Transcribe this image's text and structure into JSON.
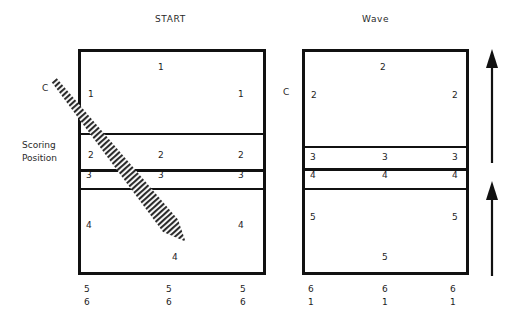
{
  "diagram": {
    "titles": {
      "left": "START",
      "right": "Wave"
    },
    "labels": {
      "scoring_position": "Scoring\nPosition",
      "coach_left": "C",
      "coach_right": "C"
    },
    "left_court": {
      "name": "START",
      "rows": [
        {
          "position": "1",
          "back": "1",
          "left": "1",
          "right": "1"
        },
        {
          "position": "2",
          "left": "2",
          "center": "2",
          "right": "2"
        },
        {
          "position": "3",
          "left": "3",
          "center": "3",
          "right": "3"
        },
        {
          "position": "4",
          "left": "4",
          "center": "4",
          "right": "4"
        }
      ],
      "bottom": [
        {
          "top": "5",
          "bottom": "6"
        },
        {
          "top": "5",
          "bottom": "6"
        },
        {
          "top": "5",
          "bottom": "6"
        }
      ]
    },
    "right_court": {
      "name": "Wave",
      "rows": [
        {
          "position": "2",
          "back": "2",
          "left": "2",
          "right": "2"
        },
        {
          "position": "3",
          "left": "3",
          "center": "3",
          "right": "3"
        },
        {
          "position": "4",
          "left": "4",
          "center": "4",
          "right": "4"
        },
        {
          "position": "5",
          "left": "5",
          "center": "5",
          "right": "5"
        }
      ],
      "bottom": [
        {
          "top": "6",
          "bottom": "1"
        },
        {
          "top": "6",
          "bottom": "1"
        },
        {
          "top": "6",
          "bottom": "1"
        }
      ]
    },
    "annotations": {
      "movement_arrow": "hatched-diagonal-arrow",
      "wave_arrow_upper": "up-arrow",
      "wave_arrow_lower": "up-arrow"
    },
    "colors": {
      "line": "#111111",
      "text": "#1d1d1d",
      "background": "#ffffff"
    }
  }
}
